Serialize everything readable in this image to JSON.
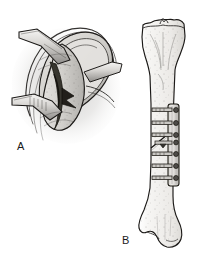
{
  "figure": {
    "kind": "medical-line-illustration",
    "background_color": "#ffffff",
    "ink_color": "#1a1a1a",
    "fill_light": "#f2f1ef",
    "fill_mid": "#d7d5d2",
    "fill_dark": "#9c9a97",
    "fill_shadow": "#4a4845",
    "panels": [
      {
        "id": "A",
        "label": "A",
        "title": "Operative exposure of fracture site with retractors",
        "description": "Oblique intraoperative view: soft-tissue envelope retracted by two retractor blades exposing the bone surface and an oblique fracture line; periosteum and fascial layers drawn as concentric curved bands with stippled bone surface.",
        "elements": [
          "retractor-blade-upper",
          "retractor-blade-lower",
          "soft-tissue-flap",
          "fascial-layer-bands",
          "exposed-bone-surface",
          "oblique-fracture-line",
          "wound-shadow"
        ]
      },
      {
        "id": "B",
        "label": "B",
        "title": "Anterior view of tibia with plate and screw fixation",
        "description": "Full-length anterior view of the tibia: proximal tibial plateau with intercondylar eminence above, diaphyseal shaft, and distal end with medial malleolus. A straight metal fixation plate is applied to the lateral shaft, secured by transverse screws, spanning an oblique mid-shaft fracture.",
        "anatomy": [
          "tibial-plateau",
          "intercondylar-eminence",
          "tibial-tuberosity",
          "tibial-shaft",
          "distal-tibia",
          "medial-malleolus"
        ],
        "hardware": {
          "plate_label": "fixation-plate",
          "screw_count": 7,
          "fracture_label": "oblique-fracture-line"
        }
      }
    ]
  }
}
